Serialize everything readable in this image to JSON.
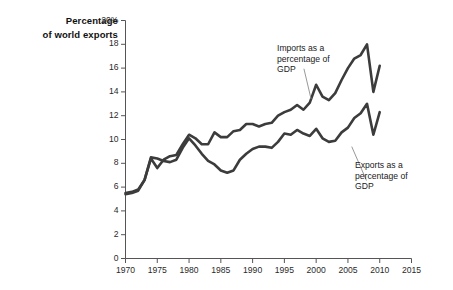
{
  "chart_data": {
    "type": "line",
    "title": "",
    "ylabel": "Percentage of world exports",
    "ylabel_line1": "Percentage",
    "ylabel_line2": "of world exports",
    "xlabel": "",
    "xlim": [
      1970,
      2015
    ],
    "ylim": [
      0,
      20
    ],
    "ytick_suffix": "%",
    "grid": false,
    "legend_position": "inline-annotations",
    "yticks": [
      0,
      2,
      4,
      6,
      8,
      10,
      12,
      14,
      16,
      18,
      20
    ],
    "ytick_labels": [
      "0",
      "2",
      "4",
      "6",
      "8",
      "10",
      "12",
      "14",
      "16",
      "18",
      "20%"
    ],
    "xticks": [
      1970,
      1975,
      1980,
      1985,
      1990,
      1995,
      2000,
      2005,
      2010,
      2015
    ],
    "xtick_labels": [
      "1970",
      "1975",
      "1980",
      "1985",
      "1990",
      "1995",
      "2000",
      "2005",
      "2010",
      "2015"
    ],
    "line_color": "#3c3c3c",
    "line_width": 2.6,
    "annotations": [
      {
        "name": "imports-label",
        "text": "Imports as a\npercentage of\nGDP",
        "x": 1996.5,
        "y": 16.2,
        "leader_to_x": 1999.2,
        "leader_to_y": 13.4
      },
      {
        "name": "exports-label",
        "text": "Exports as a\npercentage of\nGDP",
        "x": 2007.6,
        "y": 6.3,
        "leader_to_x": 2005.6,
        "leader_to_y": 9.4
      }
    ],
    "x": [
      1970,
      1971,
      1972,
      1973,
      1974,
      1975,
      1976,
      1977,
      1978,
      1979,
      1980,
      1981,
      1982,
      1983,
      1984,
      1985,
      1986,
      1987,
      1988,
      1989,
      1990,
      1991,
      1992,
      1993,
      1994,
      1995,
      1996,
      1997,
      1998,
      1999,
      2000,
      2001,
      2002,
      2003,
      2004,
      2005,
      2006,
      2007,
      2008,
      2009,
      2010
    ],
    "series": [
      {
        "name": "Imports as a percentage of GDP",
        "values": [
          5.5,
          5.6,
          5.8,
          6.6,
          8.4,
          7.6,
          8.3,
          8.6,
          8.7,
          9.6,
          10.4,
          10.1,
          9.6,
          9.6,
          10.6,
          10.2,
          10.2,
          10.7,
          10.8,
          11.3,
          11.3,
          11.1,
          11.3,
          11.4,
          12.0,
          12.3,
          12.5,
          12.9,
          12.5,
          13.1,
          14.6,
          13.6,
          13.3,
          13.9,
          15.0,
          16.0,
          16.8,
          17.1,
          18.0,
          14.0,
          16.2
        ]
      },
      {
        "name": "Exports as a percentage of GDP",
        "values": [
          5.4,
          5.5,
          5.7,
          6.6,
          8.5,
          8.4,
          8.2,
          8.1,
          8.3,
          9.3,
          10.1,
          9.5,
          8.8,
          8.2,
          7.9,
          7.4,
          7.2,
          7.4,
          8.3,
          8.8,
          9.2,
          9.4,
          9.4,
          9.3,
          9.8,
          10.5,
          10.4,
          10.8,
          10.5,
          10.3,
          10.9,
          10.1,
          9.8,
          9.9,
          10.6,
          11.0,
          11.8,
          12.2,
          13.0,
          10.4,
          12.3
        ]
      }
    ]
  }
}
